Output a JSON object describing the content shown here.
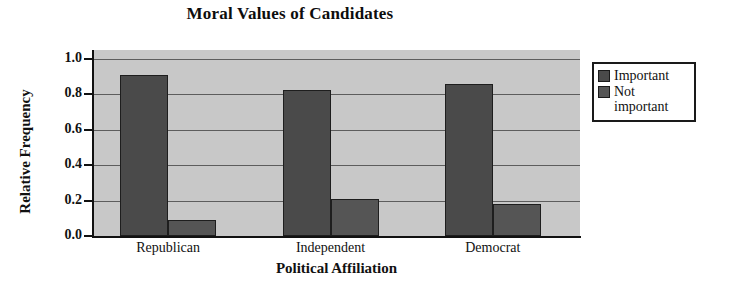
{
  "chart_data": {
    "type": "bar",
    "title": "Moral Values of Candidates",
    "xlabel": "Political Affiliation",
    "ylabel": "Relative Frequency",
    "categories": [
      "Republican",
      "Independent",
      "Democrat"
    ],
    "series": [
      {
        "name": "Important",
        "values": [
          0.91,
          0.825,
          0.86
        ],
        "color": "#4a4a4a"
      },
      {
        "name": "Not important",
        "values": [
          0.09,
          0.21,
          0.18
        ],
        "color": "#555555"
      }
    ],
    "ylim": [
      0.0,
      1.05
    ],
    "yticks": [
      "0.0",
      "0.2",
      "0.4",
      "0.6",
      "0.8",
      "1.0"
    ],
    "ytick_values": [
      0.0,
      0.2,
      0.4,
      0.6,
      0.8,
      1.0
    ],
    "grid": true,
    "grid_axis": "y",
    "legend_position": "right",
    "plot_background": "#c8c8c8",
    "figure_background": "#ffffff",
    "axis_color": "#111111",
    "gridline_color": "#5d5d5d"
  },
  "legend": {
    "entries": [
      {
        "label": "Important",
        "label_line1": "Important",
        "label_line2": ""
      },
      {
        "label": "Not important",
        "label_line1": "Not",
        "label_line2": "important"
      }
    ]
  }
}
